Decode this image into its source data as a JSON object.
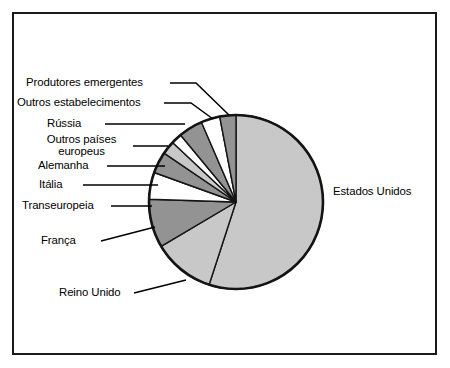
{
  "figure": {
    "frame_border_color": "#1a1a1a",
    "background": "#ffffff"
  },
  "chart_data": {
    "type": "pie",
    "title": "",
    "xlabel": "",
    "ylabel": "",
    "legend_position": "none",
    "labels_position": "outside-left-and-right",
    "slices": [
      {
        "label": "Estados Unidos",
        "value": 55.0,
        "color": "#c8c8c8",
        "label_side": "right"
      },
      {
        "label": "Reino Unido",
        "value": 11.5,
        "color": "#c8c8c8",
        "label_side": "left"
      },
      {
        "label": "França",
        "value": 9.0,
        "color": "#939393",
        "label_side": "left"
      },
      {
        "label": "Transeuropeia",
        "value": 5.0,
        "color": "#ffffff",
        "label_side": "left"
      },
      {
        "label": "Itália",
        "value": 4.0,
        "color": "#939393",
        "label_side": "left"
      },
      {
        "label": "Alemanha",
        "value": 2.5,
        "color": "#c8c8c8",
        "label_side": "left"
      },
      {
        "label": "Outros países europeus",
        "value": 2.0,
        "color": "#ffffff",
        "label_side": "left"
      },
      {
        "label": "Rússia",
        "value": 4.5,
        "color": "#939393",
        "label_side": "left"
      },
      {
        "label": "Outros estabelecimentos",
        "value": 3.5,
        "color": "#ffffff",
        "label_side": "left"
      },
      {
        "label": "Produtores emergentes",
        "value": 3.0,
        "color": "#939393",
        "label_side": "left"
      }
    ],
    "colors": {
      "light_gray": "#c8c8c8",
      "mid_gray": "#939393",
      "white": "#ffffff",
      "outline": "#141414"
    },
    "geometry": {
      "cx": 236,
      "cy": 202,
      "r": 87,
      "start_angle_deg": 0,
      "direction": "clockwise"
    }
  },
  "labels": {
    "produtores_emergentes": "Produtores emergentes",
    "outros_estabelecimentos": "Outros estabelecimentos",
    "russia": "Rússia",
    "outros_paises_europeus": "Outros países europeus",
    "alemanha": "Alemanha",
    "italia": "Itália",
    "transeuropeia": "Transeuropeia",
    "franca": "França",
    "reino_unido": "Reino Unido",
    "estados_unidos": "Estados Unidos"
  }
}
